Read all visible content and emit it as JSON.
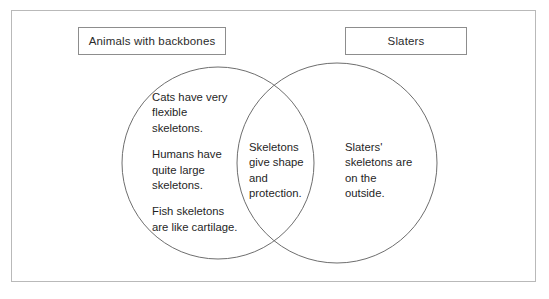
{
  "diagram": {
    "type": "venn",
    "title": "",
    "frame": {
      "border_color": "#b9b9b9",
      "background": "#ffffff"
    },
    "labels": {
      "left": "Animals with backbones",
      "right": "Slaters"
    },
    "circles": {
      "left": {
        "name": "animals-with-backbones-circle",
        "stroke": "#6e6e6e"
      },
      "right": {
        "name": "slaters-circle",
        "stroke": "#6e6e6e"
      }
    },
    "regions": {
      "left_only": {
        "name": "Animals with backbones",
        "items": [
          "Cats have very flexible skeletons.",
          "Humans have quite large skeletons.",
          "Fish skeletons are like cartilage."
        ]
      },
      "intersection": {
        "name": "Both",
        "items": [
          "Skeletons give shape and protection."
        ]
      },
      "right_only": {
        "name": "Slaters",
        "items": [
          "Slaters' skeletons are on the outside."
        ]
      }
    }
  }
}
